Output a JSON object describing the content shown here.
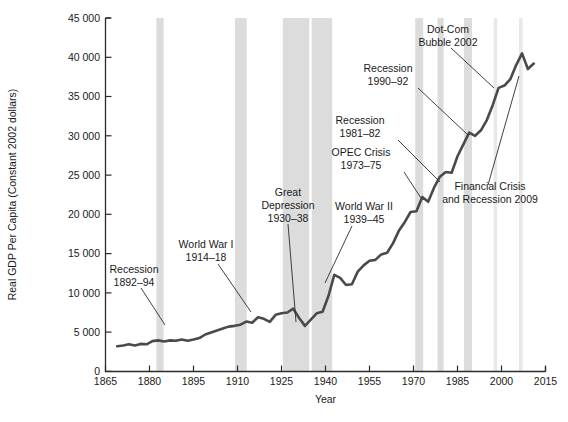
{
  "chart_data": {
    "type": "line",
    "title": "",
    "xlabel": "Year",
    "ylabel": "Real GDP Per Capita (Constant 2002 dollars)",
    "xlim": [
      1865,
      2015
    ],
    "ylim": [
      0,
      45000
    ],
    "grid": false,
    "legend": "none",
    "xticks": [
      "1865",
      "1880",
      "1895",
      "1910",
      "1925",
      "1940",
      "1955",
      "1970",
      "1985",
      "2000",
      "2015"
    ],
    "yticks": [
      "0",
      "5 000",
      "10 000",
      "15 000",
      "20 000",
      "25 000",
      "30 000",
      "35 000",
      "40 000",
      "45 000"
    ],
    "series": [
      {
        "name": "Real GDP Per Capita",
        "x": [
          1869,
          1871,
          1873,
          1875,
          1877,
          1879,
          1881,
          1883,
          1885,
          1887,
          1889,
          1891,
          1893,
          1895,
          1897,
          1899,
          1901,
          1903,
          1905,
          1907,
          1909,
          1911,
          1913,
          1915,
          1917,
          1919,
          1921,
          1923,
          1925,
          1927,
          1929,
          1931,
          1933,
          1935,
          1937,
          1939,
          1941,
          1943,
          1945,
          1947,
          1949,
          1951,
          1953,
          1955,
          1957,
          1959,
          1961,
          1963,
          1965,
          1967,
          1969,
          1971,
          1973,
          1975,
          1977,
          1979,
          1981,
          1983,
          1985,
          1987,
          1989,
          1991,
          1993,
          1995,
          1997,
          1999,
          2001,
          2003,
          2005,
          2007,
          2009,
          2011
        ],
        "values": [
          3200,
          3300,
          3450,
          3300,
          3500,
          3450,
          3850,
          3950,
          3800,
          3950,
          3900,
          4050,
          3900,
          4050,
          4250,
          4700,
          4950,
          5200,
          5450,
          5700,
          5800,
          5950,
          6350,
          6200,
          6900,
          6700,
          6300,
          7200,
          7400,
          7500,
          8000,
          6800,
          5800,
          6600,
          7400,
          7600,
          9600,
          12300,
          11900,
          11000,
          11100,
          12700,
          13500,
          14100,
          14200,
          14900,
          15100,
          16300,
          17900,
          19000,
          20300,
          20400,
          22200,
          21600,
          23400,
          24800,
          25400,
          25300,
          27400,
          28900,
          30400,
          30000,
          30700,
          32000,
          33900,
          36100,
          36400,
          37200,
          39000,
          40500,
          38500,
          39200
        ]
      }
    ],
    "shaded_bands": [
      {
        "label": "Recession 1892-94",
        "start": 1892,
        "end": 1894
      },
      {
        "label": "World War I 1914-18",
        "start": 1914,
        "end": 1918
      },
      {
        "label": "Great Depression 1930-38",
        "start": 1930,
        "end": 1938
      },
      {
        "label": "World War II 1939-45",
        "start": 1939,
        "end": 1945
      },
      {
        "label": "OPEC Crisis 1973-75",
        "start": 1973,
        "end": 1975
      },
      {
        "label": "Recession 1981-82",
        "start": 1981,
        "end": 1982
      },
      {
        "label": "Recession 1990-92",
        "start": 1990,
        "end": 1992
      },
      {
        "label": "Dot-Com Bubble 2002",
        "start": 2001,
        "end": 2002
      },
      {
        "label": "Financial Crisis and Recession 2009",
        "start": 2008,
        "end": 2009
      }
    ],
    "annotations": [
      {
        "id": "recession-1892",
        "line1": "Recession",
        "line2": "1892–94"
      },
      {
        "id": "world-war-1",
        "line1": "World War I",
        "line2": "1914–18"
      },
      {
        "id": "great-depression",
        "line1": "Great",
        "line2": "Depression",
        "line3": "1930–38"
      },
      {
        "id": "world-war-2",
        "line1": "World War II",
        "line2": "1939–45"
      },
      {
        "id": "opec-crisis",
        "line1": "OPEC Crisis",
        "line2": "1973–75"
      },
      {
        "id": "recession-1981",
        "line1": "Recession",
        "line2": "1981–82"
      },
      {
        "id": "recession-1990",
        "line1": "Recession",
        "line2": "1990–92"
      },
      {
        "id": "dotcom-bubble",
        "line1": "Dot-Com",
        "line2": "Bubble 2002"
      },
      {
        "id": "financial-crisis",
        "line1": "Financial Crisis",
        "line2": "and Recession 2009"
      }
    ],
    "colors": {
      "line": "#4a4a4a",
      "band": "#dcdcdc",
      "thin_band": "#e8e8e8",
      "axis": "#2b2b2b",
      "background": "#ffffff"
    }
  }
}
